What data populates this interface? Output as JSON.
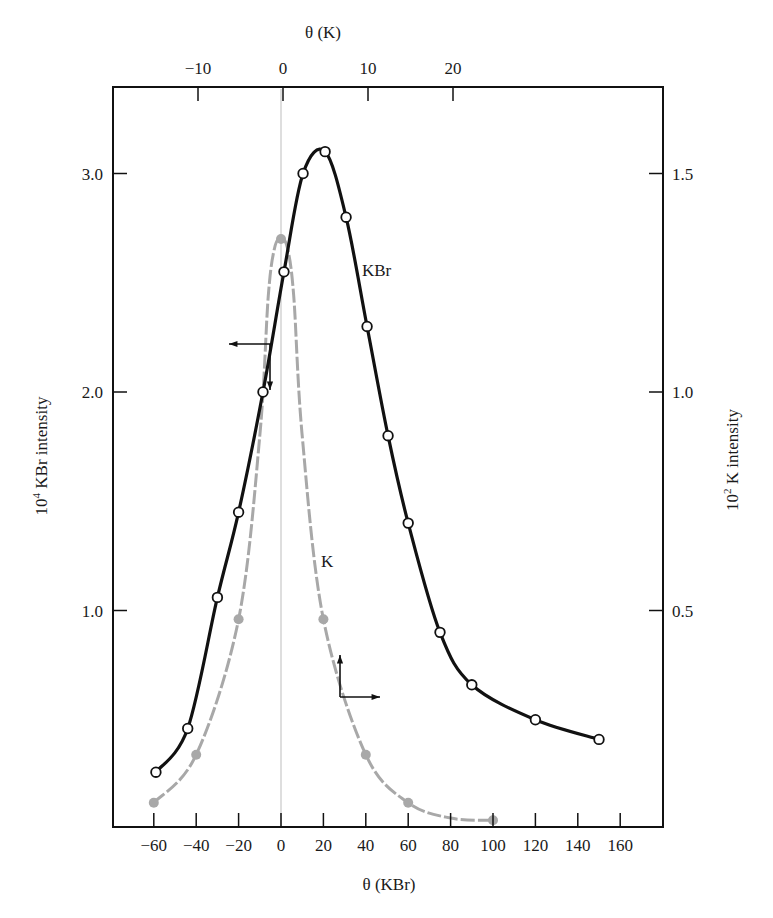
{
  "chart_data": {
    "type": "line",
    "title": "",
    "xlabel": "θ (KBr)",
    "x2label": "θ (K)",
    "ylabel": "10⁴ KBr intensity",
    "y2label": "10² K intensity",
    "xlim": [
      -78,
      182
    ],
    "ylim": [
      0,
      3.38
    ],
    "y2lim": [
      0,
      1.69
    ],
    "grid": false,
    "legend": "inline labels",
    "x_ticks": [
      -60,
      -40,
      -20,
      0,
      20,
      40,
      60,
      80,
      100,
      120,
      140,
      160
    ],
    "x_tick_labels": [
      "−60",
      "−40",
      "−20",
      "0",
      "20",
      "40",
      "60",
      "80",
      "100",
      "120",
      "140",
      "160"
    ],
    "x2_ticks": [
      -10,
      0,
      10,
      20
    ],
    "x2_tick_labels": [
      "−10",
      "0",
      "10",
      "20"
    ],
    "y_ticks": [
      1.0,
      2.0,
      3.0
    ],
    "y_tick_labels": [
      "1.0",
      "2.0",
      "3.0"
    ],
    "y2_ticks": [
      0.5,
      1.0,
      1.5
    ],
    "y2_tick_labels": [
      "0.5",
      "1.0",
      "1.5"
    ],
    "series": [
      {
        "name": "KBr",
        "axis": "left",
        "marker": "open-circle",
        "color": "#111111",
        "x": [
          -59,
          -44,
          -30,
          -20,
          -8.5,
          1.4,
          10.4,
          20.8,
          30.7,
          40.6,
          50.5,
          60,
          75,
          90,
          120,
          150
        ],
        "values": [
          0.26,
          0.46,
          1.06,
          1.45,
          2.0,
          2.55,
          3.0,
          3.1,
          2.8,
          2.3,
          1.8,
          1.4,
          0.9,
          0.66,
          0.5,
          0.41
        ]
      },
      {
        "name": "K",
        "axis": "right",
        "marker": "filled-circle",
        "color": "#a8a8a8",
        "x": [
          -60,
          -40,
          -20,
          0,
          20,
          40,
          60,
          100
        ],
        "values": [
          0.06,
          0.17,
          0.48,
          1.35,
          0.48,
          0.17,
          0.06,
          0.02
        ]
      }
    ],
    "annotations": [
      {
        "text": "KBr",
        "note": "label near KBr curve"
      },
      {
        "text": "K",
        "note": "label near K curve"
      },
      {
        "text": "←",
        "note": "arrow pointing to left axis (KBr curve)"
      },
      {
        "text": "↑→",
        "note": "arrows pointing to right axis / top axis (K curve)"
      }
    ]
  },
  "labels": {
    "kbr_series": "KBr",
    "k_series": "K",
    "x_bottom_title": "θ (KBr)",
    "x_top_title": "θ (K)",
    "y_left_title_base": "10",
    "y_left_title_exp": "4",
    "y_left_title_rest": " KBr intensity",
    "y_right_title_base": "10",
    "y_right_title_exp": "2",
    "y_right_title_rest": " K intensity"
  }
}
